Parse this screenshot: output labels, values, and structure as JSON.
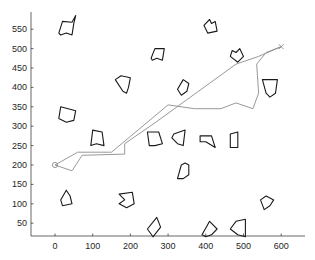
{
  "chart_data": {
    "type": "line",
    "title": "",
    "xlabel": "",
    "ylabel": "",
    "xlim": [
      -65,
      665
    ],
    "ylim": [
      15,
      590
    ],
    "grid": false,
    "legend": null,
    "x_ticks": [
      0,
      100,
      200,
      300,
      400,
      500,
      600
    ],
    "y_ticks": [
      50,
      100,
      150,
      200,
      250,
      300,
      350,
      400,
      450,
      500,
      550
    ],
    "start": {
      "x": 0,
      "y": 200,
      "marker": "circle"
    },
    "goal": {
      "x": 600,
      "y": 505,
      "marker": "x"
    },
    "series": [
      {
        "name": "path-1",
        "color": "#8c8c8c",
        "points": [
          [
            0,
            200
          ],
          [
            60,
            233
          ],
          [
            150,
            233
          ],
          [
            300,
            355
          ],
          [
            370,
            345
          ],
          [
            440,
            345
          ],
          [
            480,
            360
          ],
          [
            525,
            345
          ],
          [
            540,
            385
          ],
          [
            535,
            460
          ],
          [
            560,
            490
          ],
          [
            600,
            505
          ]
        ]
      },
      {
        "name": "path-2",
        "color": "#8c8c8c",
        "points": [
          [
            0,
            200
          ],
          [
            45,
            185
          ],
          [
            72,
            225
          ],
          [
            185,
            228
          ],
          [
            185,
            255
          ],
          [
            270,
            312
          ],
          [
            480,
            460
          ],
          [
            540,
            480
          ],
          [
            600,
            505
          ]
        ]
      }
    ],
    "obstacles": [
      {
        "name": "obstacle-1",
        "points": [
          [
            10,
            540
          ],
          [
            20,
            570
          ],
          [
            45,
            568
          ],
          [
            55,
            585
          ],
          [
            50,
            565
          ],
          [
            45,
            535
          ],
          [
            30,
            540
          ],
          [
            15,
            535
          ]
        ]
      },
      {
        "name": "obstacle-2",
        "points": [
          [
            395,
            560
          ],
          [
            410,
            575
          ],
          [
            415,
            565
          ],
          [
            425,
            570
          ],
          [
            430,
            545
          ],
          [
            405,
            540
          ]
        ]
      },
      {
        "name": "obstacle-3",
        "points": [
          [
            255,
            475
          ],
          [
            265,
            500
          ],
          [
            290,
            500
          ],
          [
            285,
            470
          ],
          [
            270,
            475
          ],
          [
            258,
            470
          ]
        ]
      },
      {
        "name": "obstacle-4",
        "points": [
          [
            465,
            480
          ],
          [
            470,
            495
          ],
          [
            480,
            490
          ],
          [
            490,
            500
          ],
          [
            500,
            480
          ],
          [
            485,
            465
          ]
        ]
      },
      {
        "name": "obstacle-5",
        "points": [
          [
            160,
            420
          ],
          [
            175,
            430
          ],
          [
            200,
            425
          ],
          [
            195,
            400
          ],
          [
            190,
            385
          ],
          [
            180,
            390
          ]
        ]
      },
      {
        "name": "obstacle-6",
        "points": [
          [
            325,
            395
          ],
          [
            340,
            420
          ],
          [
            355,
            410
          ],
          [
            350,
            390
          ],
          [
            335,
            380
          ]
        ]
      },
      {
        "name": "obstacle-7",
        "points": [
          [
            550,
            420
          ],
          [
            590,
            420
          ],
          [
            585,
            385
          ],
          [
            570,
            375
          ],
          [
            560,
            385
          ]
        ]
      },
      {
        "name": "obstacle-8",
        "points": [
          [
            10,
            320
          ],
          [
            15,
            350
          ],
          [
            35,
            345
          ],
          [
            55,
            340
          ],
          [
            50,
            315
          ],
          [
            30,
            310
          ]
        ]
      },
      {
        "name": "obstacle-9",
        "points": [
          [
            100,
            290
          ],
          [
            125,
            285
          ],
          [
            130,
            250
          ],
          [
            110,
            255
          ],
          [
            95,
            250
          ]
        ]
      },
      {
        "name": "obstacle-10",
        "points": [
          [
            245,
            285
          ],
          [
            275,
            285
          ],
          [
            285,
            255
          ],
          [
            265,
            250
          ],
          [
            250,
            250
          ]
        ]
      },
      {
        "name": "obstacle-11",
        "points": [
          [
            315,
            280
          ],
          [
            345,
            290
          ],
          [
            340,
            250
          ],
          [
            325,
            255
          ],
          [
            310,
            270
          ]
        ]
      },
      {
        "name": "obstacle-12",
        "points": [
          [
            385,
            275
          ],
          [
            415,
            275
          ],
          [
            425,
            245
          ],
          [
            400,
            260
          ],
          [
            385,
            260
          ]
        ]
      },
      {
        "name": "obstacle-13",
        "points": [
          [
            465,
            280
          ],
          [
            485,
            285
          ],
          [
            485,
            245
          ],
          [
            465,
            245
          ]
        ]
      },
      {
        "name": "obstacle-14",
        "points": [
          [
            325,
            165
          ],
          [
            335,
            200
          ],
          [
            345,
            205
          ],
          [
            355,
            200
          ],
          [
            355,
            175
          ],
          [
            340,
            165
          ]
        ]
      },
      {
        "name": "obstacle-15",
        "points": [
          [
            15,
            110
          ],
          [
            30,
            135
          ],
          [
            40,
            120
          ],
          [
            45,
            100
          ],
          [
            20,
            95
          ]
        ]
      },
      {
        "name": "obstacle-16",
        "points": [
          [
            170,
            125
          ],
          [
            205,
            130
          ],
          [
            210,
            100
          ],
          [
            190,
            90
          ],
          [
            170,
            100
          ],
          [
            185,
            110
          ]
        ]
      },
      {
        "name": "obstacle-17",
        "points": [
          [
            545,
            110
          ],
          [
            560,
            120
          ],
          [
            580,
            110
          ],
          [
            570,
            95
          ],
          [
            555,
            85
          ]
        ]
      },
      {
        "name": "obstacle-18",
        "points": [
          [
            245,
            35
          ],
          [
            270,
            65
          ],
          [
            280,
            40
          ],
          [
            260,
            15
          ]
        ]
      },
      {
        "name": "obstacle-19",
        "points": [
          [
            390,
            20
          ],
          [
            410,
            55
          ],
          [
            430,
            35
          ],
          [
            415,
            20
          ],
          [
            400,
            15
          ]
        ]
      },
      {
        "name": "obstacle-20",
        "points": [
          [
            465,
            35
          ],
          [
            480,
            55
          ],
          [
            505,
            60
          ],
          [
            505,
            15
          ],
          [
            485,
            20
          ]
        ]
      }
    ]
  }
}
